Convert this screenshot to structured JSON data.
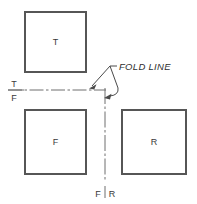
{
  "diagram": {
    "colors": {
      "view_border": "#565656",
      "fold_line": "#6e6e6e",
      "leader": "#4a4a4a",
      "text": "#3a3a3a",
      "background": "#ffffff"
    },
    "views": [
      {
        "id": "top",
        "label": "T",
        "x": 25,
        "y": 12,
        "w": 61,
        "h": 60
      },
      {
        "id": "front",
        "label": "F",
        "x": 25,
        "y": 110,
        "w": 61,
        "h": 64
      },
      {
        "id": "right",
        "label": "R",
        "x": 122,
        "y": 110,
        "w": 64,
        "h": 64
      }
    ],
    "fold_lines": [
      {
        "id": "t-f-fold",
        "orientation": "horizontal",
        "upper_label": "T",
        "lower_label": "F",
        "label_x": 14,
        "upper_label_y": 84,
        "lower_label_y": 100,
        "x1": 8,
        "x2": 106,
        "y": 90
      },
      {
        "id": "f-r-fold",
        "orientation": "vertical",
        "left_label": "F",
        "right_label": "R",
        "label_y": 194,
        "left_label_x": 98,
        "right_label_x": 112,
        "x": 105,
        "y1": 88,
        "y2": 182
      }
    ],
    "callout": {
      "label": "FOLD LINE",
      "text_x": 119,
      "text_y": 70,
      "leader_vertex_x": 117,
      "leader_vertex_y": 66
    },
    "arrows": [
      {
        "id": "arrow-to-horizontal-fold",
        "tip_x": 89,
        "tip_y": 88,
        "points_at": "t-f-fold"
      },
      {
        "id": "arrow-to-vertical-fold",
        "tip_x": 104,
        "tip_y": 97,
        "points_at": "f-r-fold"
      }
    ]
  }
}
